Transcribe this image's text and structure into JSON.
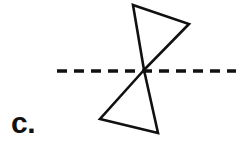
{
  "figure": {
    "label": "c.",
    "background_color": "#ffffff",
    "stroke_color": "#111111",
    "axis": {
      "name": "dashed-horizontal-line",
      "orientation": "horizontal",
      "y": 71,
      "x_start": 57,
      "x_end": 236,
      "dash_length": 10,
      "gap_length": 7,
      "stroke_width": 3.4
    },
    "shapes": [
      {
        "name": "upper-triangle",
        "points": "133,5 189,24 144,70",
        "vertices": [
          {
            "x": 133,
            "y": 5
          },
          {
            "x": 189,
            "y": 24
          },
          {
            "x": 144,
            "y": 70
          }
        ]
      },
      {
        "name": "lower-triangle",
        "points": "144,70 100,119 158,133",
        "vertices": [
          {
            "x": 144,
            "y": 70
          },
          {
            "x": 100,
            "y": 119
          },
          {
            "x": 158,
            "y": 133
          }
        ]
      }
    ],
    "intersection_point": {
      "x": 144,
      "y": 70
    }
  }
}
